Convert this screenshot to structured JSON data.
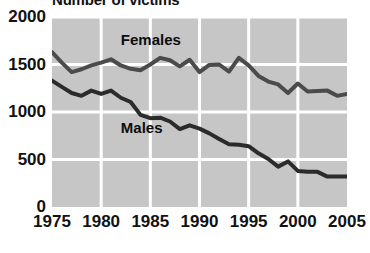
{
  "chart_data": {
    "type": "line",
    "title": "Number of victims",
    "xlabel": "",
    "ylabel": "",
    "xlim": [
      1975,
      2005
    ],
    "ylim": [
      0,
      2000
    ],
    "grid": true,
    "legend_position": "inline",
    "x_ticks": [
      "1975",
      "1980",
      "1985",
      "1990",
      "1995",
      "2000",
      "2005"
    ],
    "y_ticks": [
      "0",
      "500",
      "1000",
      "1500",
      "2000"
    ],
    "x": [
      1975,
      1976,
      1977,
      1978,
      1979,
      1980,
      1981,
      1982,
      1983,
      1984,
      1985,
      1986,
      1987,
      1988,
      1989,
      1990,
      1991,
      1992,
      1993,
      1994,
      1995,
      1996,
      1997,
      1998,
      1999,
      2000,
      2001,
      2002,
      2003,
      2004,
      2005
    ],
    "series": [
      {
        "name": "Females",
        "color": "#4b4b4b",
        "values": [
          1630,
          1520,
          1420,
          1450,
          1490,
          1520,
          1555,
          1490,
          1455,
          1440,
          1500,
          1570,
          1545,
          1480,
          1550,
          1420,
          1495,
          1500,
          1425,
          1570,
          1490,
          1380,
          1320,
          1290,
          1200,
          1300,
          1215,
          1220,
          1225,
          1170,
          1190
        ]
      },
      {
        "name": "Males",
        "color": "#2b2b2b",
        "values": [
          1330,
          1265,
          1200,
          1170,
          1225,
          1190,
          1225,
          1150,
          1105,
          970,
          935,
          940,
          900,
          820,
          860,
          825,
          775,
          715,
          660,
          655,
          640,
          565,
          505,
          425,
          480,
          380,
          370,
          370,
          320,
          320,
          320
        ]
      }
    ],
    "annotations": [
      {
        "text": "Females",
        "x": 1982,
        "y": 1760
      },
      {
        "text": "Males",
        "x": 1982,
        "y": 830
      }
    ]
  },
  "colors": {
    "plot_background": "#c6c6c6",
    "gridline": "#ffffff",
    "page_background": "#ffffff",
    "text": "#121212"
  }
}
